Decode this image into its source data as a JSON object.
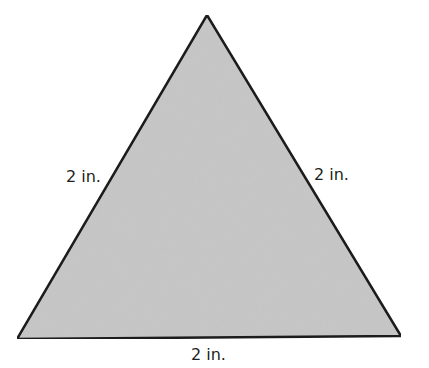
{
  "diagram": {
    "shape": "equilateral-triangle",
    "fill_color": "#c8c8c8",
    "stroke_color": "#1a1a1a",
    "vertices": [
      [
        207,
        15
      ],
      [
        17,
        339
      ],
      [
        401,
        336
      ]
    ],
    "labels": {
      "left_side": "2 in.",
      "right_side": "2 in.",
      "bottom_side": "2 in."
    }
  }
}
